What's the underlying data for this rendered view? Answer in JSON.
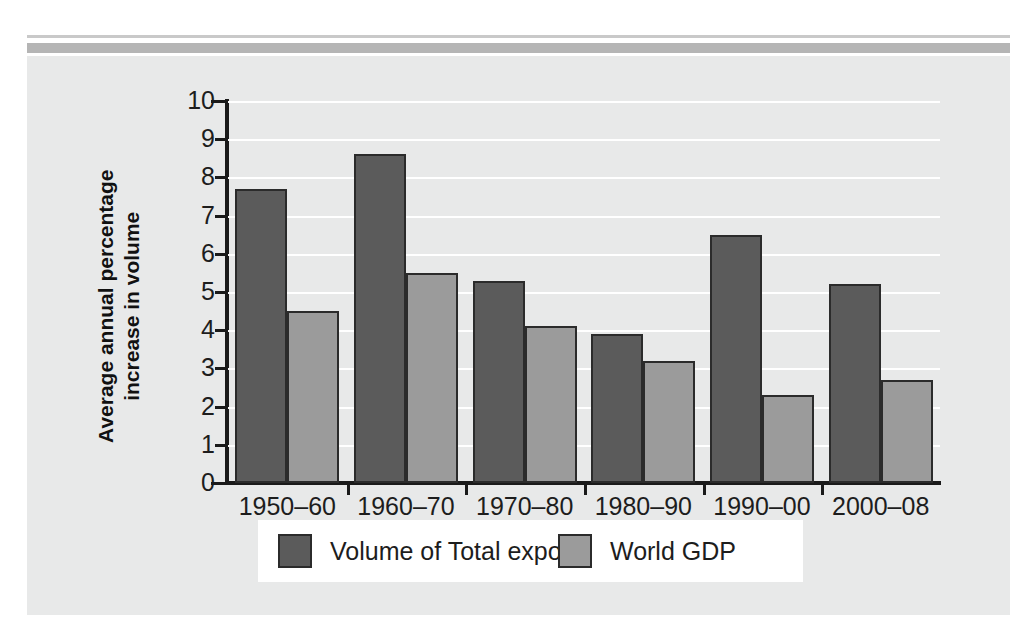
{
  "chart_data": {
    "type": "bar",
    "title": "",
    "subtitle": "",
    "xlabel": "",
    "ylabel": "Average annual percentage increase in volume",
    "ylabel_line1": "Average annual percentage",
    "ylabel_line2": "increase in volume",
    "categories": [
      "1950–60",
      "1960–70",
      "1970–80",
      "1980–90",
      "1990–00",
      "2000–08"
    ],
    "series": [
      {
        "name": "Volume of Total exports",
        "color": "#5b5b5b",
        "values": [
          7.7,
          8.6,
          5.3,
          3.9,
          6.5,
          5.2
        ]
      },
      {
        "name": "World GDP",
        "color": "#9b9b9b",
        "values": [
          4.5,
          5.5,
          4.1,
          3.2,
          2.3,
          2.7
        ]
      }
    ],
    "ylim": [
      0,
      10
    ],
    "ytick_values": [
      0,
      1,
      2,
      3,
      4,
      5,
      6,
      7,
      8,
      9,
      10
    ],
    "ytick_labels": [
      "0",
      "1",
      "2",
      "3",
      "4",
      "5",
      "6",
      "7",
      "8",
      "9",
      "10"
    ],
    "grid": true,
    "grid_color": "#ffffff",
    "legend_position": "bottom",
    "panel_background": "#e8e9e9",
    "axis_color": "#1a1a1a",
    "bar_outline_color": "#2b2b2b"
  }
}
